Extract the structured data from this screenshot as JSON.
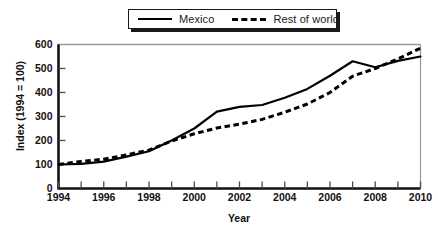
{
  "chart_data": {
    "type": "line",
    "title": "",
    "xlabel": "Year",
    "ylabel": "Index (1994 = 100)",
    "xlim": [
      1994,
      2010
    ],
    "ylim": [
      0,
      600
    ],
    "yticks": [
      0,
      100,
      200,
      300,
      400,
      500,
      600
    ],
    "xticks": [
      1994,
      1996,
      1998,
      2000,
      2002,
      2004,
      2006,
      2008,
      2010
    ],
    "xticks_minor": [
      1995,
      1997,
      1999,
      2001,
      2003,
      2005,
      2007,
      2009
    ],
    "grid": false,
    "legend_position": "top-center",
    "x": [
      1994,
      1995,
      1996,
      1997,
      1998,
      1999,
      2000,
      2001,
      2002,
      2003,
      2004,
      2005,
      2006,
      2007,
      2008,
      2009,
      2010
    ],
    "series": [
      {
        "name": "Mexico",
        "style": "solid",
        "color": "#000000",
        "values": [
          100,
          103,
          112,
          133,
          155,
          200,
          250,
          320,
          340,
          348,
          378,
          415,
          470,
          530,
          505,
          532,
          550
        ]
      },
      {
        "name": "Rest of world",
        "style": "dashed",
        "color": "#000000",
        "values": [
          100,
          113,
          122,
          140,
          160,
          198,
          228,
          252,
          268,
          288,
          318,
          352,
          400,
          468,
          500,
          540,
          585
        ]
      }
    ]
  },
  "legend": {
    "items": [
      {
        "label": "Mexico"
      },
      {
        "label": "Rest of world"
      }
    ]
  },
  "axes": {
    "y_title": "Index (1994 = 100)",
    "x_title": "Year",
    "y_tick_labels": [
      "0",
      "100",
      "200",
      "300",
      "400",
      "500",
      "600"
    ],
    "x_tick_labels": [
      "1994",
      "1996",
      "1998",
      "2000",
      "2002",
      "2004",
      "2006",
      "2008",
      "2010"
    ]
  },
  "colors": {
    "line": "#000000",
    "axis": "#111111",
    "frame": "#9a9a9a",
    "background": "#ffffff"
  }
}
